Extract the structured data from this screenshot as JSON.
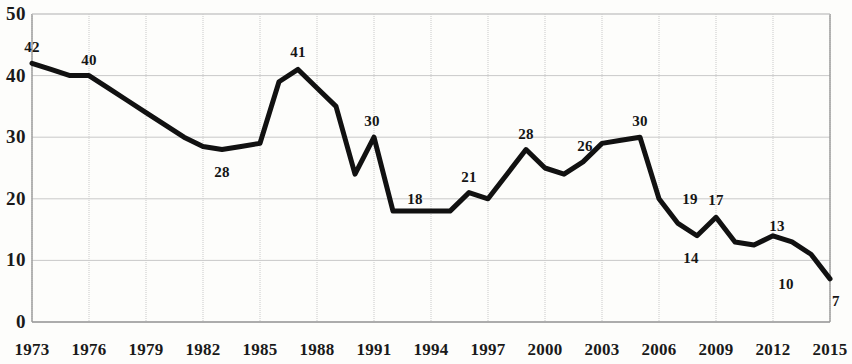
{
  "chart_data": {
    "type": "line",
    "title": "",
    "subtitle": "",
    "xlabel": "",
    "ylabel": "",
    "grid": true,
    "legend": "none",
    "xlim": [
      1973,
      2015
    ],
    "ylim": [
      0,
      50
    ],
    "y_ticks": [
      0,
      10,
      20,
      30,
      40,
      50
    ],
    "y_tick_labels": [
      "0",
      "10",
      "20",
      "30",
      "40",
      "50"
    ],
    "x_ticks": [
      1973,
      1976,
      1979,
      1982,
      1985,
      1988,
      1991,
      1994,
      1997,
      2000,
      2003,
      2006,
      2009,
      2012,
      2015
    ],
    "x_tick_labels": [
      "1973",
      "1976",
      "1979",
      "1982",
      "1985",
      "1988",
      "1991",
      "1994",
      "1997",
      "2000",
      "2003",
      "2006",
      "2009",
      "2012",
      "2015"
    ],
    "x": [
      1973,
      1974,
      1975,
      1976,
      1977,
      1978,
      1979,
      1980,
      1981,
      1982,
      1983,
      1984,
      1985,
      1986,
      1987,
      1988,
      1989,
      1990,
      1991,
      1992,
      1993,
      1994,
      1995,
      1996,
      1997,
      1998,
      1999,
      2000,
      2001,
      2002,
      2003,
      2004,
      2005,
      2006,
      2007,
      2008,
      2009,
      2010,
      2011,
      2012,
      2013,
      2014,
      2015
    ],
    "values": [
      42,
      41,
      40,
      40,
      38,
      36,
      34,
      32,
      30,
      28.5,
      28,
      28.5,
      29,
      39,
      41,
      38,
      35,
      24,
      30,
      18,
      18,
      18,
      18,
      21,
      20,
      24,
      28,
      25,
      24,
      26,
      29,
      29.5,
      30,
      20,
      16,
      14,
      17,
      13,
      12.5,
      14,
      13,
      11,
      7
    ],
    "point_labels": [
      {
        "year": 1973,
        "value": 42,
        "text": "42"
      },
      {
        "year": 1976,
        "value": 40,
        "text": "40"
      },
      {
        "year": 1983,
        "value": 28,
        "text": "28"
      },
      {
        "year": 1987,
        "value": 41,
        "text": "41"
      },
      {
        "year": 1991,
        "value": 30,
        "text": "30"
      },
      {
        "year": 1993,
        "value": 18,
        "text": "18"
      },
      {
        "year": 1996,
        "value": 21,
        "text": "21"
      },
      {
        "year": 1999,
        "value": 28,
        "text": "28"
      },
      {
        "year": 2002,
        "value": 26,
        "text": "26"
      },
      {
        "year": 2005,
        "value": 30,
        "text": "30"
      },
      {
        "year": 2007,
        "value": 19,
        "text": "19"
      },
      {
        "year": 2008,
        "value": 14,
        "text": "14"
      },
      {
        "year": 2009,
        "value": 17,
        "text": "17"
      },
      {
        "year": 2012,
        "value": 13,
        "text": "13"
      },
      {
        "year": 2013,
        "value": 10,
        "text": "10"
      },
      {
        "year": 2015,
        "value": 7,
        "text": "7"
      }
    ],
    "series": [
      {
        "name": "series-1",
        "color": "#111111",
        "line_width": 5,
        "values": [
          42,
          41,
          40,
          40,
          38,
          36,
          34,
          32,
          30,
          28.5,
          28,
          28.5,
          29,
          39,
          41,
          38,
          35,
          24,
          30,
          18,
          18,
          18,
          18,
          21,
          20,
          24,
          28,
          25,
          24,
          26,
          29,
          29.5,
          30,
          20,
          16,
          14,
          17,
          13,
          12.5,
          14,
          13,
          11,
          7
        ]
      }
    ]
  },
  "style": {
    "line_color": "#111111",
    "grid_color": "#c9c9c9",
    "axis_color": "#9a9a9a",
    "background": "#fdfdfb",
    "label_color": "#151515"
  },
  "label_offsets": [
    {
      "dx": 0,
      "dy": -16
    },
    {
      "dx": 0,
      "dy": -16
    },
    {
      "dx": 0,
      "dy": 22
    },
    {
      "dx": 0,
      "dy": -17
    },
    {
      "dx": -2,
      "dy": -16
    },
    {
      "dx": 3,
      "dy": -12
    },
    {
      "dx": 0,
      "dy": -16
    },
    {
      "dx": 0,
      "dy": -16
    },
    {
      "dx": 2,
      "dy": -16
    },
    {
      "dx": 0,
      "dy": -16
    },
    {
      "dx": 12,
      "dy": -6
    },
    {
      "dx": -6,
      "dy": 22
    },
    {
      "dx": 0,
      "dy": -17
    },
    {
      "dx": 4,
      "dy": -16
    },
    {
      "dx": -6,
      "dy": 24
    },
    {
      "dx": 6,
      "dy": 22
    }
  ]
}
